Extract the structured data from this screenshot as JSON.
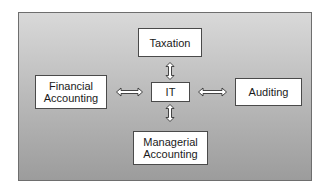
{
  "diagram": {
    "center": {
      "label": "IT"
    },
    "nodes": {
      "top": {
        "label": "Taxation"
      },
      "left": {
        "label": "Financial\nAccounting",
        "line1": "Financial",
        "line2": "Accounting"
      },
      "right": {
        "label": "Auditing"
      },
      "bottom": {
        "label": "Managerial\nAccounting",
        "line1": "Managerial",
        "line2": "Accounting"
      }
    },
    "edges": [
      {
        "from": "IT",
        "to": "Taxation",
        "type": "bidirectional"
      },
      {
        "from": "IT",
        "to": "Financial Accounting",
        "type": "bidirectional"
      },
      {
        "from": "IT",
        "to": "Auditing",
        "type": "bidirectional"
      },
      {
        "from": "IT",
        "to": "Managerial Accounting",
        "type": "bidirectional"
      }
    ],
    "colors": {
      "background_top": "#d9d9d9",
      "background_bottom": "#9c9c9c",
      "box": "#ffffff",
      "border": "#4a4a4a"
    }
  }
}
